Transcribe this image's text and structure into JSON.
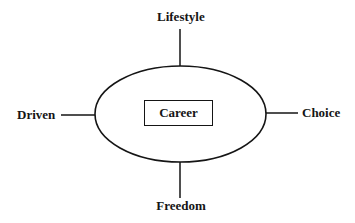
{
  "diagram": {
    "type": "radial-concept-map",
    "center": {
      "label": "Career",
      "shape": "rectangle-in-ellipse"
    },
    "nodes": {
      "top": {
        "label": "Lifestyle"
      },
      "bottom": {
        "label": "Freedom"
      },
      "left": {
        "label": "Driven"
      },
      "right": {
        "label": "Choice"
      }
    },
    "colors": {
      "stroke": "#151515",
      "background": "#ffffff",
      "text": "#151515"
    }
  }
}
